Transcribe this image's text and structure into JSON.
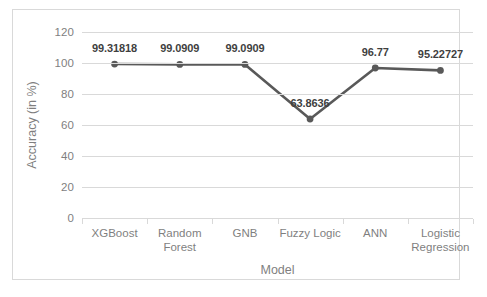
{
  "chart_data": {
    "type": "line",
    "title": "",
    "xlabel": "Model",
    "ylabel": "Accuracy (in %)",
    "categories": [
      "XGBoost",
      "Random Forest",
      "GNB",
      "Fuzzy Logic",
      "ANN",
      "Logistic Regression"
    ],
    "category_lines": [
      [
        "XGBoost"
      ],
      [
        "Random",
        "Forest"
      ],
      [
        "GNB"
      ],
      [
        "Fuzzy Logic"
      ],
      [
        "ANN"
      ],
      [
        "Logistic",
        "Regression"
      ]
    ],
    "values": [
      99.31818,
      99.0909,
      99.0909,
      63.8636,
      96.77,
      95.22727
    ],
    "data_labels": [
      "99.31818",
      "99.0909",
      "99.0909",
      "63.8636",
      "96.77",
      "95.22727"
    ],
    "ylim": [
      0,
      120
    ],
    "yticks": [
      0,
      20,
      40,
      60,
      80,
      100,
      120
    ],
    "ytick_labels": [
      "0",
      "20",
      "40",
      "60",
      "80",
      "100",
      "120"
    ],
    "grid": true,
    "legend": "none",
    "series_color": "#595959",
    "marker_color": "#595959",
    "gridline_color": "#d9d9d9",
    "axis_text_color": "#7f7f7f",
    "label_text_color": "#3f3f3f",
    "border_color": "#d9d9d9",
    "background_color": "#ffffff"
  }
}
